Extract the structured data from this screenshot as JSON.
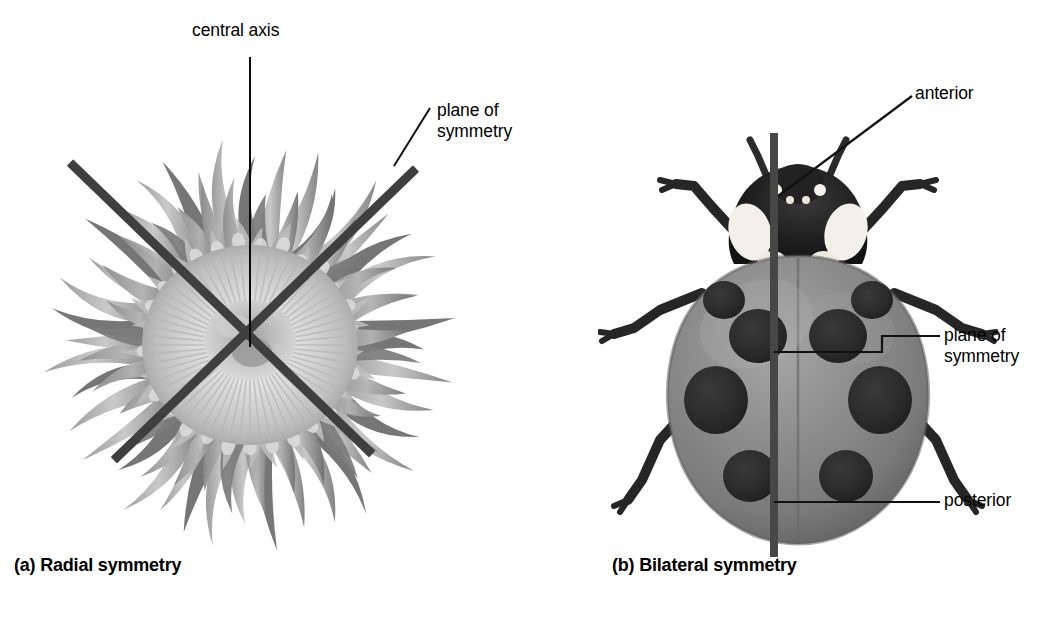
{
  "figure": {
    "title_left": "(a) Radial symmetry",
    "title_right": "(b) Bilateral symmetry",
    "background_color": "#ffffff"
  },
  "panel_a": {
    "caption": "(a) Radial symmetry",
    "organism": "sea-anemone",
    "labels": {
      "central_axis": "central axis",
      "plane_of_symmetry": "plane of\nsymmetry"
    },
    "colors": {
      "symmetry_bar": "#3f3f3f",
      "leader_line": "#111111",
      "body_light": "#e3e3e3",
      "body_mid": "#b4b4b4",
      "body_dark": "#8a8a8a",
      "tentacle_dark": "#6d6d6d"
    },
    "symmetry_planes": 2,
    "tentacle_count": 96
  },
  "panel_b": {
    "caption": "(b) Bilateral symmetry",
    "organism": "ladybug",
    "labels": {
      "anterior": "anterior",
      "plane_of_symmetry": "plane of\nsymmetry",
      "posterior": "posterior"
    },
    "colors": {
      "symmetry_bar": "#474747",
      "leader_line": "#111111",
      "elytra": "#8d8d8d",
      "elytra_shade": "#6f6f6f",
      "elytra_highlight": "#a9a9a9",
      "spot": "#2b2b2b",
      "head_dark": "#1b1b1b",
      "head_white": "#f2f0e8",
      "leg": "#272727"
    },
    "spot_count": 8,
    "leg_count": 6,
    "antenna_count": 2
  }
}
